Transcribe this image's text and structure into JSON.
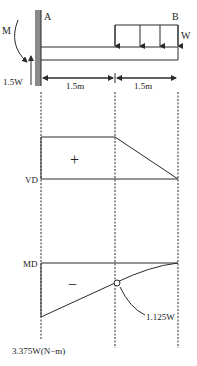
{
  "beam": {
    "label_a": "A",
    "label_b": "B",
    "moment_label": "M",
    "reaction_label": "1.5W",
    "load_label": "W",
    "span_left": "1.5m",
    "span_right": "1.5m"
  },
  "shear_diagram": {
    "label": "VD",
    "sign": "+"
  },
  "moment_diagram": {
    "label": "MD",
    "sign": "−",
    "mid_value": "1.125W",
    "end_value": "3.375W(N−m)"
  },
  "colors": {
    "line": "#2a2a2a",
    "wall": "#8a8a8a"
  }
}
